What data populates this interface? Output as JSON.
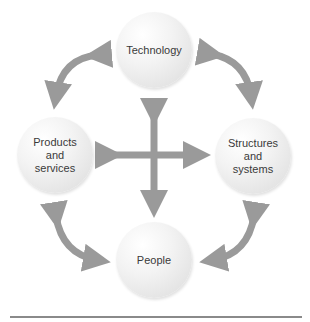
{
  "diagram": {
    "nodes": [
      {
        "id": "technology",
        "label": "Technology"
      },
      {
        "id": "products",
        "label": "Products\nand\nservices"
      },
      {
        "id": "structures",
        "label": "Structures\nand\nsystems"
      },
      {
        "id": "people",
        "label": "People"
      }
    ],
    "connections": [
      {
        "from": "technology",
        "to": "products",
        "type": "bidirectional-curved"
      },
      {
        "from": "technology",
        "to": "structures",
        "type": "bidirectional-curved"
      },
      {
        "from": "people",
        "to": "products",
        "type": "bidirectional-curved"
      },
      {
        "from": "people",
        "to": "structures",
        "type": "bidirectional-curved"
      },
      {
        "from": "technology",
        "to": "people",
        "type": "bidirectional-straight"
      },
      {
        "from": "products",
        "to": "structures",
        "type": "bidirectional-straight"
      }
    ],
    "colors": {
      "arrow": "#9a9a9a",
      "node_fill": "#eeeeee",
      "rule": "#8a8a8a"
    }
  }
}
